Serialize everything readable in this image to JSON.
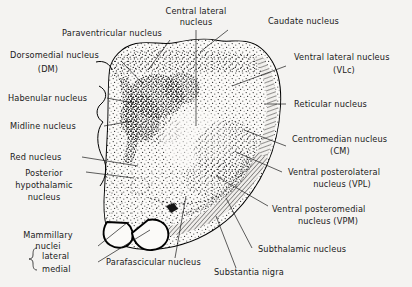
{
  "figure": {
    "background_color": "#f4f3f1",
    "ink_color": "#1a1a1a",
    "fill_color": "#fbfaf8"
  },
  "labels": {
    "central_lateral": {
      "line1": "Central lateral",
      "line2": "nucleus"
    },
    "caudate": {
      "line1": "Caudate nucleus"
    },
    "paraventricular": {
      "line1": "Paraventricular  nucleus"
    },
    "dorsomedial": {
      "line1": "Dorsomedial nucleus",
      "line2": "(DM)"
    },
    "ventral_lateral": {
      "line1": "Ventral lateral nucleus",
      "line2": "(VLc)"
    },
    "habenular": {
      "line1": "Habenular nucleus"
    },
    "reticular": {
      "line1": "Reticular nucleus"
    },
    "midline": {
      "line1": "Midline nucleus"
    },
    "centromedian": {
      "line1": "Centromedian nucleus",
      "line2": "(CM)"
    },
    "red": {
      "line1": "Red nucleus"
    },
    "posterior_hypothalamic": {
      "line1": "Posterior",
      "line2": "hypothalamic",
      "line3": "nucleus"
    },
    "ventral_posterolateral": {
      "line1": "Ventral posterolateral",
      "line2": "nucleus (VPL)"
    },
    "ventral_posteromedial": {
      "line1": "Ventral posteromedial",
      "line2": "nucleus (VPM)"
    },
    "mammillary": {
      "line1": "Mammillary",
      "line2": "nuclei",
      "sub1": "lateral",
      "sub2": "medial"
    },
    "parafascicular": {
      "line1": "Parafascicular nucleus"
    },
    "subthalamic": {
      "line1": "Subthalamic nucleus"
    },
    "substantia_nigra": {
      "line1": "Substantia  nigra"
    }
  }
}
